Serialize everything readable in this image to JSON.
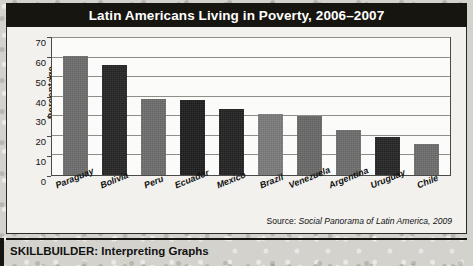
{
  "figure": {
    "title": "Latin Americans Living in Poverty, 2006–2007",
    "source": {
      "label": "Source: ",
      "publication": "Social Panorama of Latin America, 2009"
    }
  },
  "footer": {
    "skillbuilder": "SKILLBUILDER: Interpreting Graphs"
  },
  "chart_data": {
    "type": "bar",
    "title": "Latin Americans Living in Poverty, 2006–2007",
    "xlabel": "",
    "ylabel": "Percentage",
    "categories": [
      "Paraguay",
      "Bolivia",
      "Peru",
      "Ecuador",
      "Mexico",
      "Brazil",
      "Venezuela",
      "Argentina",
      "Uruguay",
      "Chile"
    ],
    "values": [
      61,
      56,
      39,
      38.5,
      33.5,
      31,
      30,
      23,
      19.5,
      16
    ],
    "bar_colors": [
      "#6e6e6e",
      "#262626",
      "#6e6e6e",
      "#1f1f1f",
      "#232323",
      "#7d7d7d",
      "#6a6a6a",
      "#6e6e6e",
      "#262626",
      "#6e6e6e"
    ],
    "ylim": [
      0,
      70
    ],
    "yticks": [
      0,
      10,
      20,
      30,
      40,
      50,
      60,
      70
    ],
    "ytick_labels": [
      "0",
      "10",
      "20",
      "30",
      "40",
      "50",
      "60",
      "70"
    ],
    "grid": true,
    "legend": null,
    "source_note": "Source: Social Panorama of Latin America, 2009"
  },
  "colors": {
    "title_bar": "#16150f",
    "title_text": "#ffffff",
    "panel_bg": "#f2f1ee",
    "plot_bg": "#fbfbfa",
    "gridline": "#8e8e88",
    "axis": "#4a4a46"
  }
}
